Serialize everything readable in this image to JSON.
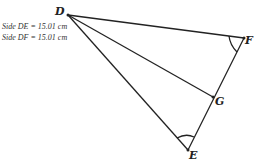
{
  "diagram": {
    "info_lines": [
      "Side DE = 15.01 cm",
      "Side DF = 15.01 cm"
    ],
    "points": {
      "D": {
        "label": "D",
        "x": 68,
        "y": 15
      },
      "F": {
        "label": "F",
        "x": 244,
        "y": 38
      },
      "G": {
        "label": "G",
        "x": 213,
        "y": 97
      },
      "E": {
        "label": "E",
        "x": 188,
        "y": 150
      }
    },
    "segments": [
      "DF",
      "DG",
      "DE",
      "FE"
    ],
    "angle_marks": [
      "F",
      "E"
    ],
    "colors": {
      "line": "#222222",
      "background": "#ffffff"
    }
  }
}
